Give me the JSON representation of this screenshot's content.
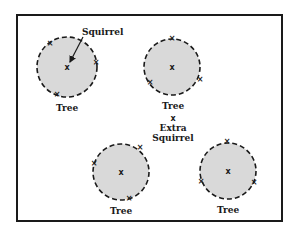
{
  "diagram": {
    "frame": {
      "x": 17,
      "y": 15,
      "width": 265,
      "height": 206
    },
    "trees": [
      {
        "label": "Tree",
        "cx": 67,
        "cy": 67,
        "r": 30,
        "center_marker": "x",
        "perimeter_markers": [
          {
            "x": 50,
            "y": 43
          },
          {
            "x": 96,
            "y": 62
          },
          {
            "x": 57,
            "y": 94
          }
        ]
      },
      {
        "label": "Tree",
        "cx": 172,
        "cy": 67,
        "r": 28,
        "center_marker": "x",
        "perimeter_markers": [
          {
            "x": 172,
            "y": 38
          },
          {
            "x": 150,
            "y": 82
          },
          {
            "x": 200,
            "y": 79
          }
        ]
      },
      {
        "label": "Tree",
        "cx": 121,
        "cy": 172,
        "r": 28,
        "center_marker": "x",
        "perimeter_markers": [
          {
            "x": 94,
            "y": 163
          },
          {
            "x": 140,
            "y": 147
          },
          {
            "x": 129,
            "y": 198
          }
        ]
      },
      {
        "label": "Tree",
        "cx": 228,
        "cy": 171,
        "r": 28,
        "center_marker": "x",
        "perimeter_markers": [
          {
            "x": 227,
            "y": 141
          },
          {
            "x": 201,
            "y": 181
          },
          {
            "x": 254,
            "y": 182
          }
        ]
      }
    ],
    "squirrel_label": "Squirrel",
    "extra_squirrel": {
      "marker": "x",
      "label_line1": "Extra",
      "label_line2": "Squirrel",
      "x": 173,
      "y": 120
    },
    "colors": {
      "fill": "#d9d9d9",
      "stroke": "#1a1a1a",
      "background": "#ffffff"
    }
  }
}
